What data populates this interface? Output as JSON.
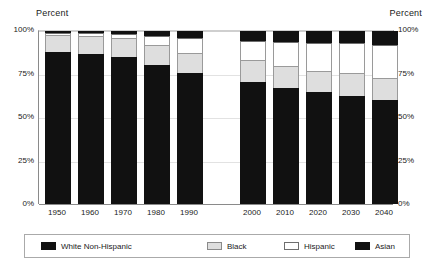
{
  "axis_captions": {
    "left": "Percent",
    "right": "Percent"
  },
  "chart_data": {
    "type": "bar",
    "subtype": "stacked-bar-100-percent",
    "title": "",
    "subtitle": "",
    "xlabel": "",
    "ylabel": "Percent",
    "ylabel_right": "Percent",
    "ylim": [
      0,
      100
    ],
    "yticks": [
      "0%",
      "25%",
      "50%",
      "75%",
      "100%"
    ],
    "ytick_values": [
      0,
      25,
      50,
      75,
      100
    ],
    "grid": true,
    "legend_position": "bottom",
    "stack_order_bottom_to_top": [
      "White Non-Hispanic",
      "Black",
      "Hispanic",
      "Asian"
    ],
    "categories": [
      "1950",
      "1960",
      "1970",
      "1980",
      "1990",
      "2000",
      "2010",
      "2020",
      "2030",
      "2040"
    ],
    "group_gap_after": "1990",
    "series": [
      {
        "name": "White Non-Hispanic",
        "color": "#111111",
        "values": [
          88,
          86.5,
          85,
          80.5,
          75.5,
          70.5,
          67,
          64.5,
          62.5,
          60
        ]
      },
      {
        "name": "Black",
        "color": "#dedede",
        "values": [
          9.5,
          10.5,
          11,
          11.5,
          12,
          12.5,
          12.5,
          12.5,
          13,
          13
        ]
      },
      {
        "name": "Hispanic",
        "color": "#ffffff",
        "values": [
          1.5,
          2,
          2.5,
          5,
          8.5,
          11.5,
          14,
          16,
          17.5,
          19
        ]
      },
      {
        "name": "Asian",
        "color": "#111111",
        "values": [
          1,
          1,
          1.5,
          3,
          4,
          5.5,
          6.5,
          7,
          7,
          8
        ]
      }
    ]
  },
  "legend": {
    "items": [
      {
        "label": "White Non-Hispanic",
        "swatch": "sw-dark"
      },
      {
        "label": "Black",
        "swatch": "sw-gray"
      },
      {
        "label": "Hispanic",
        "swatch": "sw-white"
      },
      {
        "label": "Asian",
        "swatch": "sw-dark"
      }
    ]
  }
}
